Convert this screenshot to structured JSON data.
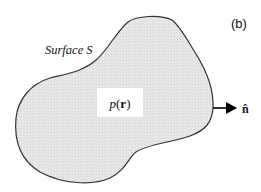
{
  "figure": {
    "panel_label": "(b)",
    "surface_label": "Surface S",
    "density_label_italic": "p",
    "density_label_open": "(",
    "density_label_bold": "r",
    "density_label_close": ")",
    "normal_label": "n̂",
    "colors": {
      "fill": "#e6e6e6",
      "outline": "#333333",
      "label_box": "#ffffff",
      "arrow": "#000000"
    }
  }
}
